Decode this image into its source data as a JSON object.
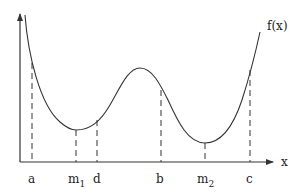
{
  "diagram": {
    "function_label": "f(x)",
    "x_axis_label": "x",
    "curve": {
      "start": [
        25,
        15
      ],
      "local_min_1": [
        76,
        130
      ],
      "local_max": [
        140,
        68
      ],
      "local_min_2": [
        205,
        143
      ],
      "end": [
        260,
        32
      ]
    },
    "axis": {
      "origin": [
        20,
        162
      ],
      "y_top": 13,
      "x_right": 272
    },
    "markers": [
      {
        "id": "a",
        "label": "a",
        "sub": "",
        "x": 32,
        "y_top": 63,
        "style": "dashed"
      },
      {
        "id": "m1",
        "label": "m",
        "sub": "1",
        "x": 76,
        "y_top": 130,
        "style": "dashed"
      },
      {
        "id": "d",
        "label": "d",
        "sub": "",
        "x": 97,
        "y_top": 120,
        "style": "dashed"
      },
      {
        "id": "b",
        "label": "b",
        "sub": "",
        "x": 161,
        "y_top": 90,
        "style": "dashed"
      },
      {
        "id": "m2",
        "label": "m",
        "sub": "2",
        "x": 205,
        "y_top": 143,
        "style": "dashed"
      },
      {
        "id": "c",
        "label": "c",
        "sub": "",
        "x": 250,
        "y_top": 70,
        "style": "dashed"
      }
    ],
    "colors": {
      "stroke": "#333333",
      "background": "#ffffff"
    }
  }
}
